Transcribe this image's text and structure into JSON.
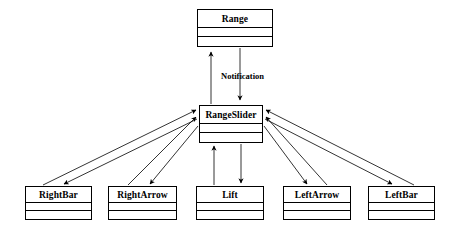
{
  "diagram": {
    "background_color": "#ffffff",
    "line_color": "#000000",
    "text_color": "#000000",
    "classes": [
      {
        "id": "range",
        "name": "Range",
        "x": 197,
        "y": 9,
        "width": 76,
        "height": 38,
        "compartments": 3
      },
      {
        "id": "rangeslider",
        "name": "RangeSlider",
        "x": 199,
        "y": 105,
        "width": 64,
        "height": 38,
        "compartments": 3
      },
      {
        "id": "rightbar",
        "name": "RightBar",
        "x": 25,
        "y": 186,
        "width": 67,
        "height": 34,
        "compartments": 3
      },
      {
        "id": "rightarrow",
        "name": "RightArrow",
        "x": 108,
        "y": 186,
        "width": 69,
        "height": 34,
        "compartments": 3
      },
      {
        "id": "lift",
        "name": "Lift",
        "x": 196,
        "y": 186,
        "width": 68,
        "height": 34,
        "compartments": 3
      },
      {
        "id": "leftarrow",
        "name": "LeftArrow",
        "x": 283,
        "y": 186,
        "width": 68,
        "height": 34,
        "compartments": 3
      },
      {
        "id": "leftbar",
        "name": "LeftBar",
        "x": 368,
        "y": 186,
        "width": 67,
        "height": 34,
        "compartments": 3
      }
    ],
    "edge_labels": [
      {
        "id": "notification",
        "text": "Notification",
        "x": 221,
        "y": 71
      }
    ],
    "connections": [
      {
        "from": "rangeslider",
        "to": "range",
        "direction": "up",
        "label": "Notification"
      },
      {
        "from": "range",
        "to": "rangeslider",
        "direction": "down",
        "label": "Notification"
      },
      {
        "from": "rightbar",
        "to": "rangeslider",
        "direction": "up"
      },
      {
        "from": "rangeslider",
        "to": "rightbar",
        "direction": "down"
      },
      {
        "from": "rightarrow",
        "to": "rangeslider",
        "direction": "up"
      },
      {
        "from": "rangeslider",
        "to": "rightarrow",
        "direction": "down"
      },
      {
        "from": "lift",
        "to": "rangeslider",
        "direction": "up"
      },
      {
        "from": "rangeslider",
        "to": "lift",
        "direction": "down"
      },
      {
        "from": "leftarrow",
        "to": "rangeslider",
        "direction": "up"
      },
      {
        "from": "rangeslider",
        "to": "leftarrow",
        "direction": "down"
      },
      {
        "from": "leftbar",
        "to": "rangeslider",
        "direction": "up"
      },
      {
        "from": "rangeslider",
        "to": "leftbar",
        "direction": "down"
      }
    ]
  }
}
